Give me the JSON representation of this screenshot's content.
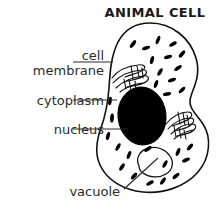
{
  "figure": {
    "title": "ANIMAL CELL",
    "background_color": "#ffffff",
    "line_color": "#111111",
    "text_color": "#2b2b2b",
    "nucleus_fill": "#000000",
    "cell_fill": "#ffffff"
  },
  "labels": {
    "cell_membrane": "cell\nmembrane",
    "cell_membrane_line1": "cell",
    "cell_membrane_line2": "membrane",
    "cytoplasm": "cytoplasm",
    "nucleus": "nucleus",
    "vacuole": "vacuole"
  },
  "diagram_data": {
    "type": "labeled-biology-diagram",
    "subject": "animal cell",
    "parts": [
      {
        "name": "cell membrane",
        "label": "cell membrane",
        "description": "outer closed kidney-bean shaped outline of the cell",
        "leader": {
          "from": [
            73,
            62
          ],
          "to": [
            113,
            62
          ],
          "style": "horizontal"
        }
      },
      {
        "name": "cytoplasm",
        "label": "cytoplasm",
        "description": "white interior area of the cell containing organelles",
        "leader": {
          "from": [
            73,
            100
          ],
          "to": [
            116,
            100
          ],
          "style": "horizontal"
        }
      },
      {
        "name": "nucleus",
        "label": "nucleus",
        "description": "large solid black oval near the cell centre",
        "leader": {
          "from": [
            73,
            129
          ],
          "to": [
            127,
            129
          ],
          "style": "horizontal"
        }
      },
      {
        "name": "vacuole",
        "label": "vacuole",
        "description": "white outlined bean shape in lower part of the cell",
        "leader": {
          "from": [
            124,
            188
          ],
          "to": [
            156,
            160
          ],
          "style": "diagonal"
        }
      }
    ],
    "unlabeled_features": [
      {
        "name": "golgi-apparatus-upper-left",
        "count": 1
      },
      {
        "name": "golgi-apparatus-right",
        "count": 1
      },
      {
        "name": "mitochondria-dashes",
        "count": 26
      }
    ]
  }
}
